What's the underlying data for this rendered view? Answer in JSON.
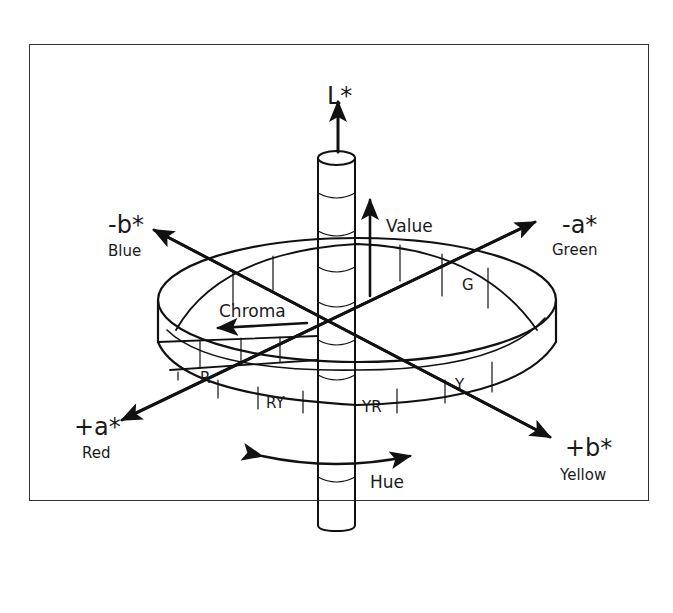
{
  "figure": {
    "type": "CIELAB color space diagram",
    "axes": {
      "l": {
        "label": "L*"
      },
      "minus_b": {
        "label": "-b*",
        "color_name": "Blue"
      },
      "minus_a": {
        "label": "-a*",
        "color_name": "Green"
      },
      "plus_a": {
        "label": "+a*",
        "color_name": "Red"
      },
      "plus_b": {
        "label": "+b*",
        "color_name": "Yellow"
      }
    },
    "annotations": {
      "value": "Value",
      "chroma": "Chroma",
      "hue": "Hue"
    },
    "hue_segments": {
      "g": "G",
      "r": "R",
      "ry": "RY",
      "yr": "YR",
      "y": "Y"
    }
  }
}
